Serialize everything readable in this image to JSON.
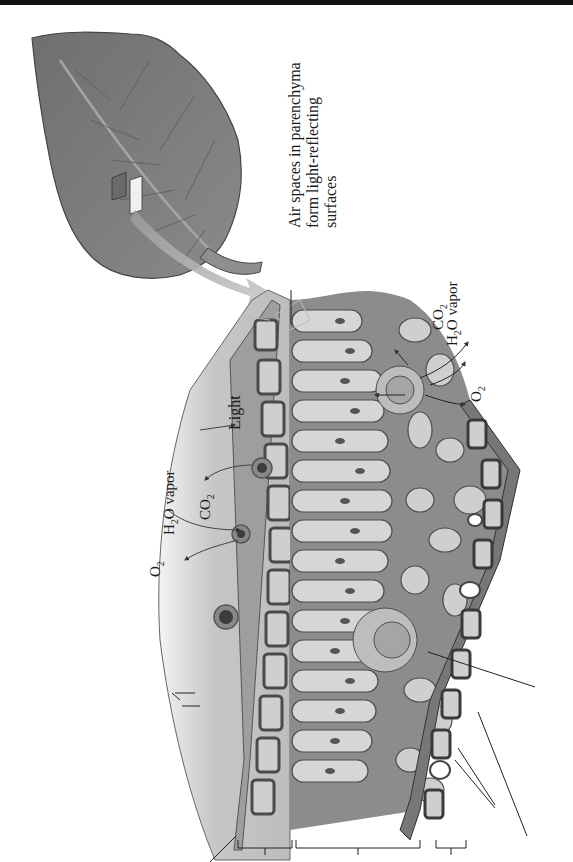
{
  "figure": {
    "orientation": "rotated-90-ccw",
    "colors": {
      "background": "#ffffff",
      "top_bar": "#111111",
      "leaf_fill": "#7d7d7d",
      "cell_light": "#d2d2d2",
      "cell_mid": "#a9a9a9",
      "cell_dark": "#5e5e5e",
      "outline": "#333333",
      "arrow_big": "#b3b3b3",
      "leader_line": "#222222"
    }
  },
  "labels": {
    "light": "Light",
    "left_h2o": "H",
    "left_h2o_sub": "2",
    "left_h2o_rest": "O vapor",
    "left_co2": "CO",
    "left_co2_sub": "2",
    "left_o2": "O",
    "left_o2_sub": "2",
    "air_spaces_line1": "Air spaces in parenchyma",
    "air_spaces_line2": "form light-reflecting",
    "air_spaces_line3": "surfaces",
    "right_co2": "CO",
    "right_co2_sub": "2",
    "right_h2o": "H",
    "right_h2o_sub": "2",
    "right_h2o_rest": "O vapor",
    "right_o2": "O",
    "right_o2_sub": "2"
  },
  "unlabeled_callouts": [
    "cuticle-leader",
    "upper-epidermis-bracket",
    "palisade-bracket",
    "spongy-bracket",
    "lower-epidermis-bracket",
    "vascular-bundle-leader",
    "stomata-leader",
    "lower-cuticle-leader",
    "trichome-leader"
  ]
}
